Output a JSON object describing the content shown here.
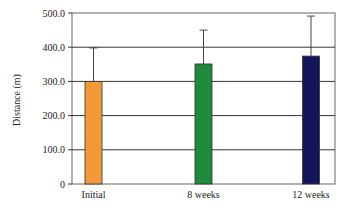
{
  "chart_data": {
    "type": "bar",
    "title": "",
    "xlabel": "",
    "ylabel": "Distance (m)",
    "categories": [
      "Initial",
      "8 weeks",
      "12 weeks"
    ],
    "values": [
      300,
      351,
      374
    ],
    "error_plus": [
      98,
      99,
      117
    ],
    "colors": [
      "#f29a38",
      "#1f8a3b",
      "#14145a"
    ],
    "ylim": [
      0,
      500
    ],
    "yticks": [
      0,
      100,
      200,
      300,
      400,
      500
    ],
    "ytick_labels": [
      "0",
      "100.0",
      "200.0",
      "300.0",
      "400.0",
      "500.0"
    ],
    "grid": true,
    "legend": null
  }
}
